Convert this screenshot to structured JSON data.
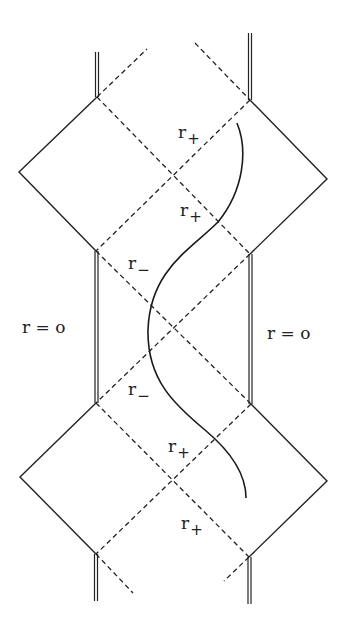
{
  "figure": {
    "type": "Penrose diagram (charged black hole, Reissner-Nordström maximal extension)",
    "labels": {
      "r_plus_1": {
        "base": "r",
        "sub": "+"
      },
      "r_plus_2": {
        "base": "r",
        "sub": "+"
      },
      "r_minus_1": {
        "base": "r",
        "sub": "−"
      },
      "r_minus_2": {
        "base": "r",
        "sub": "−"
      },
      "r_plus_3": {
        "base": "r",
        "sub": "+"
      },
      "r_plus_4": {
        "base": "r",
        "sub": "+"
      },
      "singularity_left": "r = o",
      "singularity_right": "r = o"
    },
    "colors": {
      "ink": "#222222",
      "background": "#ffffff"
    }
  }
}
